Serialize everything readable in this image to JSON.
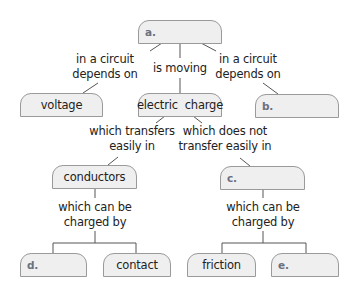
{
  "diagram": {
    "type": "concept-map",
    "colors": {
      "box_fill": "#efefef",
      "box_border": "#9a9a9a",
      "line": "#555555",
      "blank_label": "#6b7080",
      "text": "#222222"
    },
    "nodes": {
      "a": {
        "label": "a.",
        "blank": true
      },
      "voltage": {
        "label": "voltage",
        "blank": false
      },
      "electric_charge": {
        "label": "electric  charge",
        "blank": false
      },
      "b": {
        "label": "b.",
        "blank": true
      },
      "conductors": {
        "label": "conductors",
        "blank": false
      },
      "c": {
        "label": "c.",
        "blank": true
      },
      "d": {
        "label": "d.",
        "blank": true
      },
      "contact": {
        "label": "contact",
        "blank": false
      },
      "friction": {
        "label": "friction",
        "blank": false
      },
      "e": {
        "label": "e.",
        "blank": true
      }
    },
    "links": {
      "a_to_voltage": {
        "line1": "in a circuit",
        "line2": "depends on"
      },
      "a_to_charge": {
        "line1": "is moving"
      },
      "a_to_b": {
        "line1": "in a circuit",
        "line2": "depends on"
      },
      "charge_to_conductors": {
        "line1": "which transfers",
        "line2": "easily in"
      },
      "charge_to_c": {
        "line1": "which does not",
        "line2": "transfer easily in"
      },
      "conductors_to_children": {
        "line1": "which can be",
        "line2": "charged by"
      },
      "c_to_children": {
        "line1": "which can be",
        "line2": "charged by"
      }
    },
    "edges": [
      [
        "a",
        "voltage",
        "in a circuit depends on"
      ],
      [
        "a",
        "electric_charge",
        "is moving"
      ],
      [
        "a",
        "b",
        "in a circuit depends on"
      ],
      [
        "electric_charge",
        "conductors",
        "which transfers easily in"
      ],
      [
        "electric_charge",
        "c",
        "which does not transfer easily in"
      ],
      [
        "conductors",
        "d",
        "which can be charged by"
      ],
      [
        "conductors",
        "contact",
        "which can be charged by"
      ],
      [
        "c",
        "friction",
        "which can be charged by"
      ],
      [
        "c",
        "e",
        "which can be charged by"
      ]
    ]
  }
}
